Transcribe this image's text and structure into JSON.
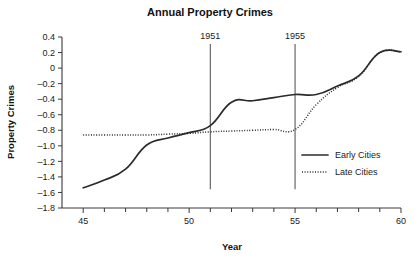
{
  "chart_data": {
    "type": "line",
    "title": "Annual Property Crimes",
    "xlabel": "Year",
    "ylabel": "Property Crimes",
    "xlim": [
      44,
      60
    ],
    "ylim": [
      -1.8,
      0.4
    ],
    "grid": false,
    "legend_position": "right-inside",
    "x_ticks_major": [
      45,
      50,
      55,
      60
    ],
    "x_tick_labels": [
      "45",
      "50",
      "55",
      "60"
    ],
    "x_ticks_minor": [
      46,
      47,
      48,
      49,
      51,
      52,
      53,
      54,
      56,
      57,
      58,
      59
    ],
    "y_ticks": [
      0.4,
      0.2,
      0,
      -0.2,
      -0.4,
      -0.6,
      -0.8,
      -1.0,
      -1.2,
      -1.4,
      -1.6,
      -1.8
    ],
    "y_tick_labels": [
      "0.4",
      "0.2",
      "0",
      "–0.2",
      "–0.4",
      "–0.6",
      "–0.8",
      "–1.0",
      "–1.2",
      "–1.4",
      "–1.6",
      "–1.8"
    ],
    "series": [
      {
        "name": "Early Cities",
        "style": "solid",
        "color": "#2b2b2b",
        "x": [
          45,
          46,
          47,
          48,
          49,
          50,
          51,
          52,
          53,
          54,
          55,
          56,
          57,
          58,
          59,
          60
        ],
        "values": [
          -1.54,
          -1.44,
          -1.3,
          -0.99,
          -0.9,
          -0.83,
          -0.74,
          -0.44,
          -0.42,
          -0.38,
          -0.34,
          -0.34,
          -0.23,
          -0.1,
          0.2,
          0.21
        ]
      },
      {
        "name": "Late Cities",
        "style": "dotted",
        "color": "#2b2b2b",
        "x": [
          45,
          46,
          47,
          48,
          49,
          50,
          51,
          52,
          53,
          54,
          55,
          56,
          57,
          58,
          59,
          60
        ],
        "values": [
          -0.86,
          -0.86,
          -0.86,
          -0.86,
          -0.85,
          -0.84,
          -0.82,
          -0.81,
          -0.8,
          -0.79,
          -0.79,
          -0.47,
          -0.25,
          -0.11,
          0.2,
          0.21
        ]
      }
    ],
    "annotations": [
      {
        "label": "1951",
        "x": 51,
        "type": "vertical-reference-line",
        "y_top": 0.31,
        "y_bottom": -1.56
      },
      {
        "label": "1955",
        "x": 55,
        "type": "vertical-reference-line",
        "y_top": 0.31,
        "y_bottom": -1.56
      }
    ],
    "legend": [
      {
        "label": "Early Cities",
        "style": "solid"
      },
      {
        "label": "Late Cities",
        "style": "dotted"
      }
    ]
  }
}
